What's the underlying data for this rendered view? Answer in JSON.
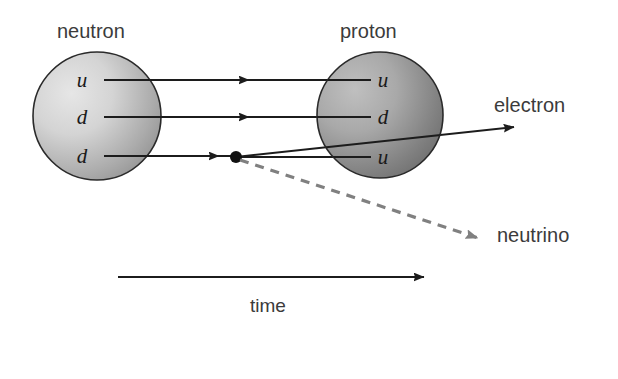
{
  "diagram": {
    "title_text": "",
    "particles": {
      "neutron": {
        "label": "neutron",
        "quarks": [
          "u",
          "d",
          "d"
        ]
      },
      "proton": {
        "label": "proton",
        "quarks": [
          "u",
          "d",
          "u"
        ]
      }
    },
    "emissions": {
      "electron": "electron",
      "neutrino": "neutrino"
    },
    "axis": {
      "label": "time"
    },
    "colors": {
      "line": "#1c1c1c",
      "neutrino_line": "#808080",
      "text": "#3b3b3b",
      "quark_text": "#1a1a1a",
      "neutron_light": "#dcdcdc",
      "neutron_dark": "#8c8c8c",
      "proton_light": "#b0b0b0",
      "proton_dark": "#606060",
      "background": "#ffffff"
    }
  }
}
